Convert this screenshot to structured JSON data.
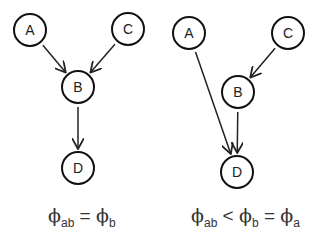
{
  "diagrams": [
    {
      "id": "left",
      "nodes": [
        {
          "label": "A",
          "cx": 30,
          "cy": 30
        },
        {
          "label": "C",
          "cx": 128,
          "cy": 29
        },
        {
          "label": "B",
          "cx": 78,
          "cy": 87
        },
        {
          "label": "D",
          "cx": 78,
          "cy": 168
        }
      ],
      "edges": [
        {
          "from": "A",
          "to": "B"
        },
        {
          "from": "C",
          "to": "B"
        },
        {
          "from": "B",
          "to": "D"
        }
      ],
      "formula": {
        "parts": [
          {
            "sym": "ϕ",
            "sub": "ab"
          },
          {
            "op": " = "
          },
          {
            "sym": "ϕ",
            "sub": "b"
          }
        ]
      }
    },
    {
      "id": "right",
      "nodes": [
        {
          "label": "A",
          "cx": 189,
          "cy": 33
        },
        {
          "label": "C",
          "cx": 288,
          "cy": 33
        },
        {
          "label": "B",
          "cx": 238,
          "cy": 92
        },
        {
          "label": "D",
          "cx": 237,
          "cy": 172
        }
      ],
      "edges": [
        {
          "from": "A",
          "to": "D"
        },
        {
          "from": "C",
          "to": "B"
        },
        {
          "from": "B",
          "to": "D"
        }
      ],
      "formula": {
        "parts": [
          {
            "sym": "ϕ",
            "sub": "ab"
          },
          {
            "op": " < "
          },
          {
            "sym": "ϕ",
            "sub": "b"
          },
          {
            "op": " = "
          },
          {
            "sym": "ϕ",
            "sub": "a"
          }
        ]
      }
    }
  ],
  "labels": {
    "left_formula_text": "ϕab = ϕb",
    "right_formula_text": "ϕab < ϕb = ϕa"
  }
}
